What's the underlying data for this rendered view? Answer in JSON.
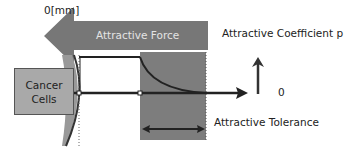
{
  "labels": {
    "origin": "0[mm]",
    "force_band": "Attractive Force",
    "coefficient": "Attractive Coefficient p",
    "zero": "0",
    "tolerance": "Attractive Tolerance",
    "cancer_line1": "Cancer",
    "cancer_line2": "Cells"
  },
  "colors": {
    "band": "#777777",
    "tolerance_region": "#7d7d7d",
    "cancer_box": "#a9a9a9",
    "lines": "#333333"
  }
}
